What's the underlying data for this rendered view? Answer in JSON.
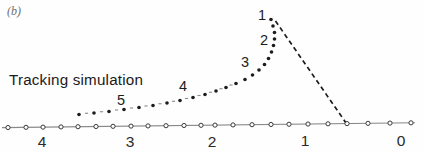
{
  "figure_label": "(b)",
  "title": "Tracking simulation",
  "colors": {
    "ink": "#1c1c1c",
    "axis_line": "#888888",
    "marker_stroke": "#3a3a3a",
    "marker_fill": "#ffffff",
    "inter_dot_dash": "#8a8a8a",
    "tick_text": "#2a2a2a",
    "panel_label": "#6e6e6e"
  },
  "chart_data": {
    "type": "scatter",
    "title": "Tracking simulation",
    "panel": "(b)",
    "legend": "none",
    "grid": false,
    "x_axis": {
      "tick_labels": [
        "4",
        "3",
        "2",
        "1",
        "0"
      ],
      "tick_label_positions": [
        [
          42,
          141
        ],
        [
          130,
          141
        ],
        [
          212,
          141
        ],
        [
          305,
          140
        ],
        [
          401,
          140
        ]
      ],
      "line": {
        "x1": 2,
        "y1": 127.6,
        "x2": 415,
        "y2": 122.8
      },
      "marker_positions_x": [
        8,
        26,
        43,
        61,
        78,
        96,
        113,
        131,
        148,
        166,
        184,
        201,
        215,
        233,
        252,
        271,
        289,
        308,
        328,
        347,
        368,
        390,
        411
      ],
      "marker_style": "open-circle"
    },
    "trajectory": {
      "style": "dotted",
      "points": [
        [
          79,
          114.5
        ],
        [
          94,
          113
        ],
        [
          109,
          111.5
        ],
        [
          124,
          109.5
        ],
        [
          139,
          107.5
        ],
        [
          153,
          105.5
        ],
        [
          167,
          103
        ],
        [
          180,
          100.5
        ],
        [
          193,
          97.5
        ],
        [
          205,
          94.5
        ],
        [
          216,
          91
        ],
        [
          226,
          87.5
        ],
        [
          236,
          83.5
        ],
        [
          245,
          79.5
        ],
        [
          252.5,
          75
        ],
        [
          259,
          70
        ],
        [
          264.5,
          64.5
        ],
        [
          268.5,
          58.5
        ],
        [
          271.5,
          52
        ],
        [
          273.5,
          45.5
        ],
        [
          274.5,
          39
        ],
        [
          274.5,
          32.5
        ],
        [
          273,
          26
        ],
        [
          271,
          19.5
        ]
      ]
    },
    "point_labels": [
      {
        "text": "1",
        "x": 262,
        "y": 15
      },
      {
        "text": "2",
        "x": 264,
        "y": 40
      },
      {
        "text": "3",
        "x": 245,
        "y": 62
      },
      {
        "text": "4",
        "x": 183,
        "y": 86
      },
      {
        "text": "5",
        "x": 121,
        "y": 100
      }
    ],
    "dashed_line": {
      "x1": 275.5,
      "y1": 21,
      "x2": 346.2,
      "y2": 123.2
    }
  }
}
